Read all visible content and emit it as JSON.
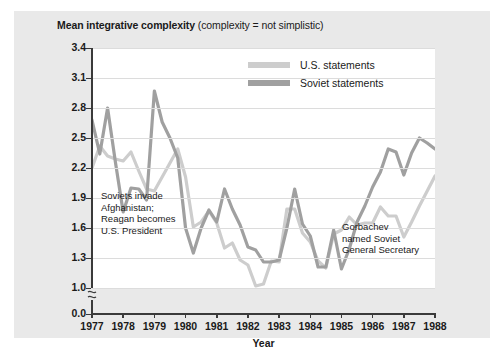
{
  "title": {
    "bold": "Mean integrative complexity",
    "normal": " (complexity = not simplistic)"
  },
  "axis": {
    "x_title": "Year",
    "x_ticks": [
      "1977",
      "1978",
      "1979",
      "1980",
      "1981",
      "1982",
      "1983",
      "1984",
      "1985",
      "1986",
      "1987",
      "1988"
    ],
    "y_ticks": [
      "3.4",
      "3.1",
      "2.8",
      "2.5",
      "2.2",
      "1.9",
      "1.6",
      "1.3",
      "1.0",
      "0.0"
    ],
    "y_break_symbol": "axis-break"
  },
  "legend": {
    "items": [
      {
        "label": "U.S. statements",
        "color": "#cdcdcd"
      },
      {
        "label": "Soviet statements",
        "color": "#a0a0a0"
      }
    ]
  },
  "annotations": [
    {
      "id": "left",
      "text": "Soviets invade\nAfghanistan;\nReagan becomes\nU.S. President"
    },
    {
      "id": "right",
      "text": "Gorbachev\nnamed Soviet\nGeneral Secretary"
    }
  ],
  "colors": {
    "figure_background": "#e9e9e9",
    "plot_background": "#ffffff",
    "gridline": "#dcdcdc",
    "axis": "#3a3a3a",
    "text": "#1a1a1a",
    "us_line": "#cdcdcd",
    "soviet_line": "#a0a0a0"
  },
  "chart_data": {
    "type": "line",
    "title": "Mean integrative complexity (complexity = not simplistic)",
    "xlabel": "Year",
    "ylabel": "Mean integrative complexity",
    "xlim": [
      1977,
      1988
    ],
    "ylim": [
      1.0,
      3.4
    ],
    "ytick_values": [
      3.4,
      3.1,
      2.8,
      2.5,
      2.2,
      1.9,
      1.6,
      1.3,
      1.0,
      0.0
    ],
    "y_axis_break_between": [
      1.0,
      0.0
    ],
    "grid": "horizontal",
    "legend_position": "top-right",
    "x": [
      1977.0,
      1977.25,
      1977.5,
      1977.75,
      1978.0,
      1978.25,
      1978.5,
      1978.75,
      1979.0,
      1979.25,
      1979.5,
      1979.75,
      1980.0,
      1980.25,
      1980.5,
      1980.75,
      1981.0,
      1981.25,
      1981.5,
      1981.75,
      1982.0,
      1982.25,
      1982.5,
      1982.75,
      1983.0,
      1983.25,
      1983.5,
      1983.75,
      1984.0,
      1984.25,
      1984.5,
      1984.75,
      1985.0,
      1985.25,
      1985.5,
      1985.75,
      1986.0,
      1986.25,
      1986.5,
      1986.75,
      1987.0,
      1987.25,
      1987.5,
      1987.75,
      1988.0
    ],
    "series": [
      {
        "name": "U.S. statements",
        "color": "#cdcdcd",
        "values": [
          2.2,
          2.42,
          2.32,
          2.29,
          2.27,
          2.36,
          2.17,
          1.99,
          1.97,
          2.11,
          2.25,
          2.39,
          2.11,
          1.61,
          1.66,
          1.77,
          1.65,
          1.4,
          1.45,
          1.28,
          1.23,
          1.02,
          1.04,
          1.27,
          1.26,
          1.79,
          1.79,
          1.55,
          1.46,
          1.27,
          1.2,
          1.54,
          1.58,
          1.71,
          1.63,
          1.65,
          1.65,
          1.81,
          1.72,
          1.72,
          1.51,
          1.66,
          1.82,
          1.97,
          2.12
        ]
      },
      {
        "name": "Soviet statements",
        "color": "#a0a0a0",
        "values": [
          2.68,
          2.34,
          2.8,
          2.26,
          1.76,
          2.0,
          1.99,
          1.88,
          2.97,
          2.66,
          2.5,
          2.3,
          1.6,
          1.35,
          1.6,
          1.78,
          1.66,
          1.99,
          1.79,
          1.63,
          1.41,
          1.38,
          1.26,
          1.26,
          1.28,
          1.6,
          1.99,
          1.64,
          1.52,
          1.21,
          1.21,
          1.58,
          1.19,
          1.39,
          1.66,
          1.82,
          2.01,
          2.16,
          2.39,
          2.36,
          2.13,
          2.35,
          2.5,
          2.45,
          2.39
        ]
      }
    ]
  }
}
